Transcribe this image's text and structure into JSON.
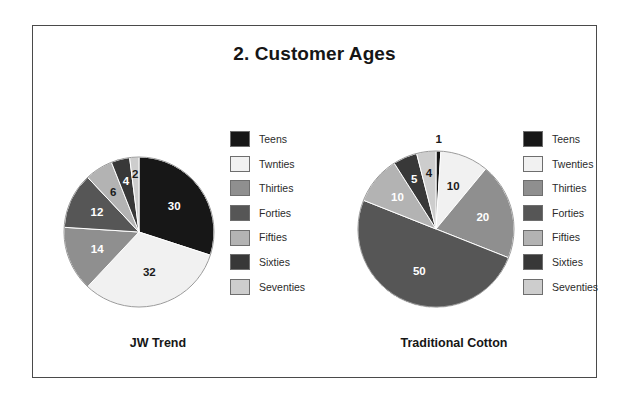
{
  "figure": {
    "title": "2. Customer Ages",
    "border_color": "#4a4a4a",
    "background": "#ffffff"
  },
  "palette": {
    "teens": "#171717",
    "twenties": "#f1f1f1",
    "thirties": "#8f8f8f",
    "forties": "#565656",
    "fifties": "#b3b3b3",
    "sixties": "#383838",
    "seventies": "#cdcdcd"
  },
  "left": {
    "category_label": "JW Trend",
    "legend": [
      {
        "label": "Teens",
        "color": "#171717"
      },
      {
        "label": "Twnties",
        "color": "#f1f1f1"
      },
      {
        "label": "Thirties",
        "color": "#8f8f8f"
      },
      {
        "label": "Forties",
        "color": "#565656"
      },
      {
        "label": "Fifties",
        "color": "#b3b3b3"
      },
      {
        "label": "Sixties",
        "color": "#383838"
      },
      {
        "label": "Seventies",
        "color": "#cdcdcd"
      }
    ],
    "slice_labels": [
      "30",
      "32",
      "14",
      "12",
      "6",
      "4",
      "2"
    ]
  },
  "right": {
    "category_label": "Traditional Cotton",
    "legend": [
      {
        "label": "Teens",
        "color": "#171717"
      },
      {
        "label": "Twenties",
        "color": "#f1f1f1"
      },
      {
        "label": "Thirties",
        "color": "#8f8f8f"
      },
      {
        "label": "Forties",
        "color": "#565656"
      },
      {
        "label": "Fifties",
        "color": "#b3b3b3"
      },
      {
        "label": "Sixties",
        "color": "#383838"
      },
      {
        "label": "Seventies",
        "color": "#cdcdcd"
      }
    ],
    "slice_labels": [
      "1",
      "10",
      "20",
      "50",
      "10",
      "5",
      "4"
    ]
  },
  "chart_data": [
    {
      "type": "pie",
      "title": "JW Trend",
      "categories": [
        "Teens",
        "Twnties",
        "Thirties",
        "Forties",
        "Fifties",
        "Sixties",
        "Seventies"
      ],
      "values": [
        30,
        32,
        14,
        12,
        6,
        4,
        2
      ],
      "colors": [
        "#171717",
        "#f1f1f1",
        "#8f8f8f",
        "#565656",
        "#b3b3b3",
        "#383838",
        "#cdcdcd"
      ],
      "total": 100,
      "start_angle_deg": 0,
      "direction": "clockwise",
      "data_labels": true,
      "legend_position": "right"
    },
    {
      "type": "pie",
      "title": "Traditional Cotton",
      "categories": [
        "Teens",
        "Twenties",
        "Thirties",
        "Forties",
        "Fifties",
        "Sixties",
        "Seventies"
      ],
      "values": [
        1,
        10,
        20,
        50,
        10,
        5,
        4
      ],
      "colors": [
        "#171717",
        "#f1f1f1",
        "#8f8f8f",
        "#565656",
        "#b3b3b3",
        "#383838",
        "#cdcdcd"
      ],
      "total": 100,
      "start_angle_deg": 0,
      "direction": "clockwise",
      "data_labels": true,
      "legend_position": "right"
    }
  ]
}
